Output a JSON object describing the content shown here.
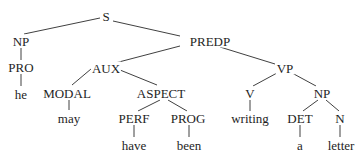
{
  "diagram": {
    "type": "syntax-tree",
    "sentence": "he may have been writing a letter",
    "nodes": [
      {
        "id": "S",
        "label": "S",
        "x": 106,
        "y": 16
      },
      {
        "id": "NP1",
        "label": "NP",
        "x": 21,
        "y": 41
      },
      {
        "id": "PREDP",
        "label": "PREDP",
        "x": 210,
        "y": 41
      },
      {
        "id": "PRO",
        "label": "PRO",
        "x": 21,
        "y": 67
      },
      {
        "id": "he",
        "label": "he",
        "x": 21,
        "y": 94
      },
      {
        "id": "AUX",
        "label": "AUX",
        "x": 106,
        "y": 68
      },
      {
        "id": "VP",
        "label": "VP",
        "x": 285,
        "y": 68
      },
      {
        "id": "MODAL",
        "label": "MODAL",
        "x": 67,
        "y": 93
      },
      {
        "id": "may",
        "label": "may",
        "x": 69,
        "y": 118
      },
      {
        "id": "ASPECT",
        "label": "ASPECT",
        "x": 161,
        "y": 93
      },
      {
        "id": "PERF",
        "label": "PERF",
        "x": 134,
        "y": 118
      },
      {
        "id": "have",
        "label": "have",
        "x": 134,
        "y": 145
      },
      {
        "id": "PROG",
        "label": "PROG",
        "x": 188,
        "y": 118
      },
      {
        "id": "been",
        "label": "been",
        "x": 189,
        "y": 145
      },
      {
        "id": "V",
        "label": "V",
        "x": 250,
        "y": 93
      },
      {
        "id": "writing",
        "label": "writing",
        "x": 250,
        "y": 118
      },
      {
        "id": "NP2",
        "label": "NP",
        "x": 322,
        "y": 93
      },
      {
        "id": "DET",
        "label": "DET",
        "x": 300,
        "y": 118
      },
      {
        "id": "a",
        "label": "a",
        "x": 300,
        "y": 145
      },
      {
        "id": "N",
        "label": "N",
        "x": 340,
        "y": 118
      },
      {
        "id": "letter",
        "label": "letter",
        "x": 341,
        "y": 145
      }
    ],
    "edges": [
      {
        "from": "S",
        "to": "NP1",
        "x1": 100,
        "y1": 18,
        "x2": 24,
        "y2": 34
      },
      {
        "from": "S",
        "to": "PREDP",
        "x1": 113,
        "y1": 21,
        "x2": 180,
        "y2": 36
      },
      {
        "from": "NP1",
        "to": "PRO",
        "x1": 21,
        "y1": 48,
        "x2": 21,
        "y2": 60
      },
      {
        "from": "PRO",
        "to": "he",
        "x1": 21,
        "y1": 74,
        "x2": 21,
        "y2": 86
      },
      {
        "from": "PREDP",
        "to": "AUX",
        "x1": 180,
        "y1": 46,
        "x2": 115,
        "y2": 63
      },
      {
        "from": "PREDP",
        "to": "VP",
        "x1": 220,
        "y1": 47,
        "x2": 275,
        "y2": 64
      },
      {
        "from": "AUX",
        "to": "MODAL",
        "x1": 91,
        "y1": 69,
        "x2": 72,
        "y2": 85
      },
      {
        "from": "AUX",
        "to": "ASPECT",
        "x1": 120,
        "y1": 70,
        "x2": 157,
        "y2": 85
      },
      {
        "from": "MODAL",
        "to": "may",
        "x1": 69,
        "y1": 100,
        "x2": 69,
        "y2": 110
      },
      {
        "from": "ASPECT",
        "to": "PERF",
        "x1": 160,
        "y1": 100,
        "x2": 138,
        "y2": 111
      },
      {
        "from": "ASPECT",
        "to": "PROG",
        "x1": 168,
        "y1": 100,
        "x2": 187,
        "y2": 111
      },
      {
        "from": "PERF",
        "to": "have",
        "x1": 134,
        "y1": 125,
        "x2": 134,
        "y2": 137
      },
      {
        "from": "PROG",
        "to": "been",
        "x1": 189,
        "y1": 125,
        "x2": 189,
        "y2": 137
      },
      {
        "from": "VP",
        "to": "V",
        "x1": 277,
        "y1": 73,
        "x2": 253,
        "y2": 86
      },
      {
        "from": "VP",
        "to": "NP2",
        "x1": 292,
        "y1": 73,
        "x2": 316,
        "y2": 86
      },
      {
        "from": "V",
        "to": "writing",
        "x1": 250,
        "y1": 100,
        "x2": 250,
        "y2": 111
      },
      {
        "from": "NP2",
        "to": "DET",
        "x1": 318,
        "y1": 100,
        "x2": 303,
        "y2": 111
      },
      {
        "from": "NP2",
        "to": "N",
        "x1": 326,
        "y1": 100,
        "x2": 339,
        "y2": 111
      },
      {
        "from": "DET",
        "to": "a",
        "x1": 300,
        "y1": 125,
        "x2": 300,
        "y2": 137
      },
      {
        "from": "N",
        "to": "letter",
        "x1": 340,
        "y1": 125,
        "x2": 340,
        "y2": 137
      }
    ],
    "colors": {
      "line": "#2a2a2a",
      "text": "#1e1e1e",
      "background": "#ffffff"
    }
  }
}
